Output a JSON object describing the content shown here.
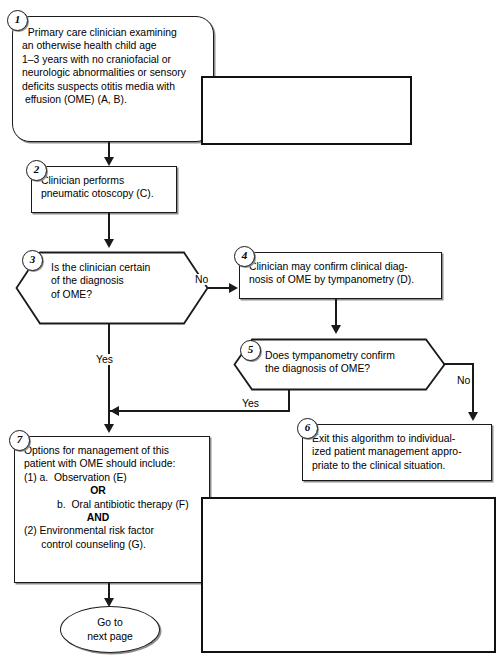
{
  "diagram": {
    "colors": {
      "line": "#1a1a1a",
      "shadow": "#8e8e8e",
      "background": "#ffffff"
    }
  },
  "nodes": {
    "n1": {
      "number": "1",
      "shape": "rounded-rectangle",
      "lines": [
        "  Primary care clinician examining",
        "an otherwise health child age",
        "1–3 years with no craniofacial or",
        "neurologic abnormalities or sensory",
        "deficits suspects otitis media with",
        " effusion (OME) (A, B)."
      ]
    },
    "n2": {
      "number": "2",
      "shape": "rectangle",
      "lines": [
        "Clinician performs",
        "pneumatic otoscopy (C)."
      ]
    },
    "n3": {
      "number": "3",
      "shape": "hexagon",
      "lines": [
        "Is the clinician certain",
        "of the diagnosis",
        "of OME?"
      ]
    },
    "n4": {
      "number": "4",
      "shape": "rectangle",
      "lines": [
        "Clinician may confirm clinical diag-",
        "nosis of OME by tympanometry (D)."
      ]
    },
    "n5": {
      "number": "5",
      "shape": "hexagon",
      "lines": [
        "Does tympanometry confirm",
        "the diagnosis of OME?"
      ]
    },
    "n6": {
      "number": "6",
      "shape": "rectangle",
      "lines": [
        "Exit this algorithm to individual-",
        "ized patient management appro-",
        "priate to the clinical situation."
      ]
    },
    "n7": {
      "number": "7",
      "shape": "rectangle",
      "lines": [
        "Options for management of this",
        "patient with OME should include:",
        "(1) a.  Observation (E)",
        "b.  Oral antibiotic therapy (F)",
        "(2) Environmental risk factor",
        "      control counseling (G)."
      ],
      "or_label": "OR",
      "and_label": "AND"
    },
    "terminal": {
      "shape": "oval",
      "lines": [
        "Go to",
        "next page"
      ]
    }
  },
  "edge_labels": {
    "n3_no": "No",
    "n3_yes": "Yes",
    "n5_yes": "Yes",
    "n5_no": "No"
  },
  "callouts": {
    "note": {
      "label": "Note:",
      "lines": [
        " The asymptomatic patient with",
        "fluid in the ear and no signs or symp-",
        "toms of ear infection by definition does",
        "not have "
      ],
      "bold_tail": "acute otitis media."
    },
    "attention": {
      "heading": "ATTENTION",
      "lines": [
        "Management of the patient at this point in the clinical",
        "course should not include:",
        "(1)  Surgery, including myringotomy with or without tube",
        "        insertion, tonsillectomy, or adenoidectomy (H)",
        "(2)  Decongestants and/or antihistamines (I)",
        "(3)  Oral steriod therapy (J)."
      ],
      "or_label": "OR"
    }
  }
}
